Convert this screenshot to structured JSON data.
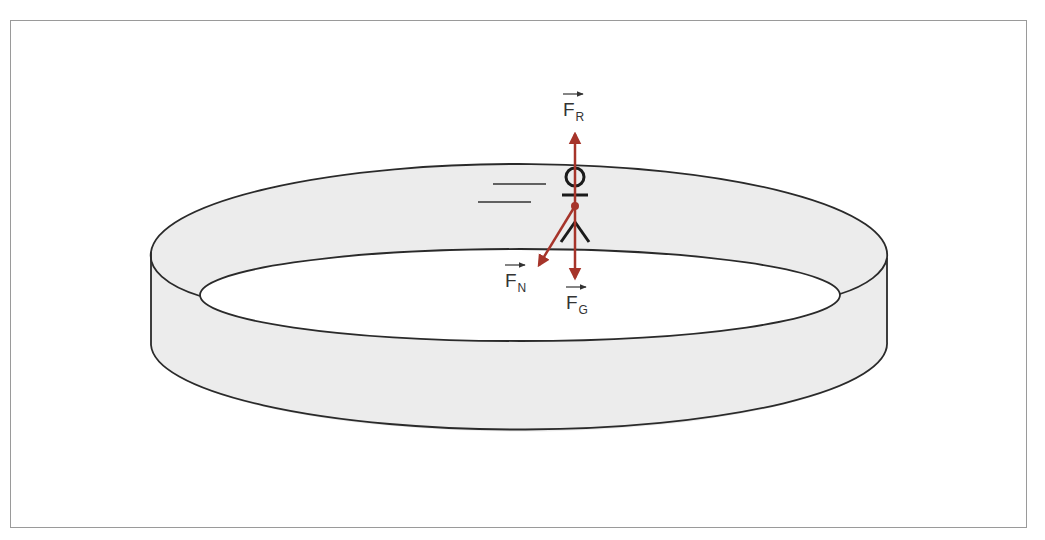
{
  "diagram": {
    "colors": {
      "ring_fill": "#ececec",
      "ring_stroke": "#2a2a2a",
      "force_arrow": "#a6342a",
      "frame_border": "#9a9a9a",
      "figure": "#1a1a1a"
    },
    "forces": [
      {
        "id": "resultant",
        "symbol": "F",
        "subscript": "R",
        "direction": "up"
      },
      {
        "id": "normal",
        "symbol": "F",
        "subscript": "N",
        "direction": "down-left"
      },
      {
        "id": "gravity",
        "symbol": "F",
        "subscript": "G",
        "direction": "down"
      }
    ]
  }
}
